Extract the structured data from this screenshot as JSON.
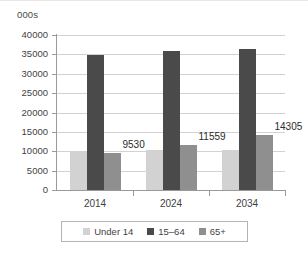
{
  "chart_data": {
    "type": "bar",
    "title": "",
    "subtitle": "",
    "xlabel": "",
    "ylabel": "000s",
    "categories": [
      "2014",
      "2024",
      "2034"
    ],
    "series": [
      {
        "name": "Under 14",
        "values": [
          9800,
          10200,
          10400
        ],
        "color": "#d2d2d2",
        "data_labels": [
          "",
          "",
          ""
        ]
      },
      {
        "name": "15–64",
        "values": [
          34800,
          35900,
          36500
        ],
        "color": "#4a4a4a",
        "data_labels": [
          "",
          "",
          ""
        ]
      },
      {
        "name": "65+",
        "values": [
          9530,
          11559,
          14305
        ],
        "color": "#8f8f8f",
        "data_labels": [
          "9530",
          "11559",
          "14305"
        ]
      }
    ],
    "ylim": [
      0,
      40000
    ],
    "y_ticks": [
      "0",
      "5000",
      "10000",
      "15000",
      "20000",
      "25000",
      "30000",
      "35000",
      "40000"
    ],
    "y_tick_values": [
      0,
      5000,
      10000,
      15000,
      20000,
      25000,
      30000,
      35000,
      40000
    ],
    "grid": true,
    "legend_position": "bottom"
  },
  "axis": {
    "unit_caption": "000s"
  },
  "legend": {
    "items": [
      {
        "label": "Under 14",
        "color": "#d2d2d2"
      },
      {
        "label": "15–64",
        "color": "#4a4a4a"
      },
      {
        "label": "65+",
        "color": "#8f8f8f"
      }
    ]
  }
}
